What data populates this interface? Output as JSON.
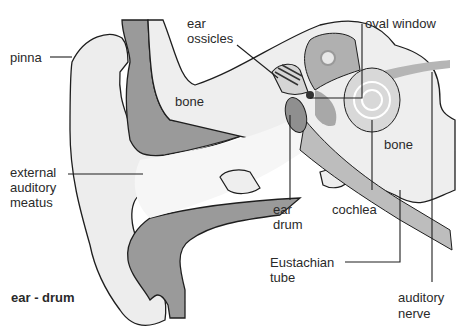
{
  "diagram": {
    "title": "ear - drum",
    "labels": {
      "pinna": "pinna",
      "ear_ossicles_1": "ear",
      "ear_ossicles_2": "ossicles",
      "oval_window": "oval window",
      "bone_upper": "bone",
      "bone_right": "bone",
      "external_1": "external",
      "external_2": "auditory",
      "external_3": "meatus",
      "ear_drum_1": "ear",
      "ear_drum_2": "drum",
      "cochlea": "cochlea",
      "eustachian_1": "Eustachian",
      "eustachian_2": "tube",
      "auditory_nerve_1": "auditory",
      "auditory_nerve_2": "nerve"
    },
    "colors": {
      "bone": "#9a9a9a",
      "tissue": "#ececec",
      "outline": "#1e1e1e",
      "inner_ear": "#b0b0b0"
    }
  }
}
